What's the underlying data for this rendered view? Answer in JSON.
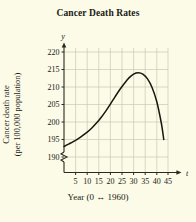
{
  "figure": {
    "title": "Cancer Death Rates",
    "background_color": "#fbfbe8",
    "grid_color": "#c9c9b4",
    "curve_color": "#17170f",
    "axis_color": "#2a2a20"
  },
  "axes": {
    "y_variable_label": "y",
    "x_variable_label": "t",
    "y_axis_title_line1": "Cancer death rate",
    "y_axis_title_line2": "(per 100,000 population)",
    "x_axis_title": "Year (0 ↔ 1960)",
    "y_ticks": [
      "190",
      "195",
      "200",
      "205",
      "210",
      "215",
      "220"
    ],
    "x_ticks": [
      "5",
      "10",
      "15",
      "20",
      "25",
      "30",
      "35",
      "40",
      "45"
    ],
    "axis_break": "zigzag"
  },
  "chart_data": {
    "type": "line",
    "title": "Cancer Death Rates",
    "xlabel": "Year (0 ↔ 1960)",
    "ylabel": "Cancer death rate (per 100,000 population)",
    "xlim": [
      0,
      47
    ],
    "ylim": [
      188,
      222
    ],
    "grid": true,
    "legend": "none",
    "x_tick_values": [
      5,
      10,
      15,
      20,
      25,
      30,
      35,
      40,
      45
    ],
    "y_tick_values": [
      190,
      195,
      200,
      205,
      210,
      215,
      220
    ],
    "y_axis_break_below": 190,
    "series": [
      {
        "name": "Cancer death rate",
        "x": [
          0,
          2,
          4,
          6,
          8,
          10,
          12,
          14,
          16,
          18,
          20,
          22,
          24,
          26,
          28,
          30,
          32,
          34,
          36,
          38,
          40,
          42,
          43
        ],
        "y": [
          193.0,
          193.7,
          194.4,
          195.2,
          196.1,
          197.1,
          198.3,
          199.7,
          201.3,
          203.1,
          205.1,
          207.2,
          209.2,
          211.0,
          212.6,
          213.7,
          214.1,
          213.7,
          212.3,
          209.8,
          205.8,
          199.5,
          195.0
        ]
      }
    ],
    "annotations": {
      "peak_x": 32,
      "peak_y": 214.1,
      "start_y": 193.0,
      "end_x": 43,
      "end_y": 195.0
    }
  }
}
